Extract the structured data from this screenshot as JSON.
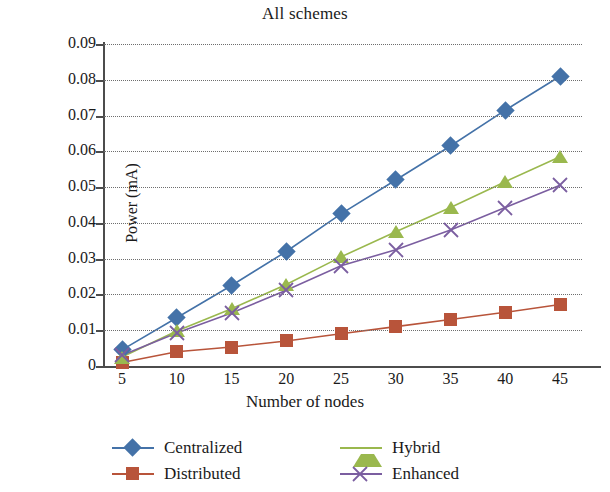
{
  "chart_data": {
    "type": "line",
    "title": "All schemes",
    "xlabel": "Number of nodes",
    "ylabel": "Power (mA)",
    "x": [
      5,
      10,
      15,
      20,
      25,
      30,
      35,
      40,
      45
    ],
    "xtick_labels": [
      "5",
      "10",
      "15",
      "20",
      "25",
      "30",
      "35",
      "40",
      "45"
    ],
    "ytick_labels": [
      "0",
      "0.01",
      "0.02",
      "0.03",
      "0.04",
      "0.05",
      "0.06",
      "0.07",
      "0.08",
      "0.09"
    ],
    "ytick_values": [
      0,
      0.01,
      0.02,
      0.03,
      0.04,
      0.05,
      0.06,
      0.07,
      0.08,
      0.09
    ],
    "xlim": [
      5,
      45
    ],
    "ylim": [
      0,
      0.09
    ],
    "grid": "horizontal-dotted",
    "legend_position": "bottom",
    "series": [
      {
        "name": "Centralized",
        "color": "#4472a8",
        "marker": "diamond",
        "values": [
          0.0045,
          0.0135,
          0.0225,
          0.032,
          0.0425,
          0.052,
          0.0615,
          0.0715,
          0.081
        ]
      },
      {
        "name": "Distributed",
        "color": "#b8543a",
        "marker": "square",
        "values": [
          0.001,
          0.004,
          0.0053,
          0.007,
          0.009,
          0.011,
          0.013,
          0.015,
          0.0172
        ]
      },
      {
        "name": "Hybrid",
        "color": "#9ab84e",
        "marker": "triangle",
        "values": [
          0.0025,
          0.0098,
          0.016,
          0.0228,
          0.0305,
          0.0375,
          0.0443,
          0.0515,
          0.0585
        ]
      },
      {
        "name": "Enhanced",
        "color": "#7b5ea0",
        "marker": "x",
        "values": [
          0.003,
          0.0092,
          0.0148,
          0.0212,
          0.028,
          0.0325,
          0.038,
          0.0443,
          0.0505
        ]
      }
    ]
  },
  "legend": {
    "items": [
      {
        "label": "Centralized"
      },
      {
        "label": "Distributed"
      },
      {
        "label": "Hybrid"
      },
      {
        "label": "Enhanced"
      }
    ]
  }
}
